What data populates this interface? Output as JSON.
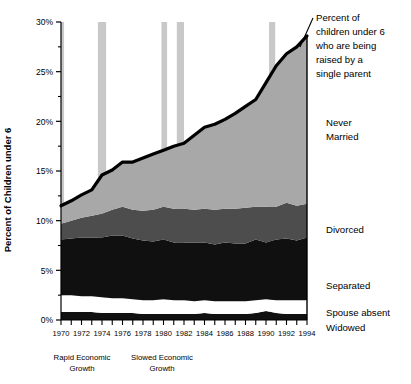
{
  "chart_data": {
    "type": "area",
    "stacked": true,
    "title": "",
    "xlabel": "",
    "ylabel": "Percent of Children under 6",
    "xlim": [
      1970,
      1994
    ],
    "ylim": [
      0,
      30
    ],
    "ytick_labels": [
      "0%",
      "5%",
      "10%",
      "15%",
      "20%",
      "25%",
      "30%"
    ],
    "ytick_values": [
      0,
      5,
      10,
      15,
      20,
      25,
      30
    ],
    "ytick_minor_values": [
      2.5,
      7.5,
      12.5,
      17.5,
      22.5,
      27.5
    ],
    "grid": false,
    "legend_position": "right-inline",
    "x": [
      1970,
      1971,
      1972,
      1973,
      1974,
      1975,
      1976,
      1977,
      1978,
      1979,
      1980,
      1981,
      1982,
      1983,
      1984,
      1985,
      1986,
      1987,
      1988,
      1989,
      1990,
      1991,
      1992,
      1993,
      1994
    ],
    "xtick_labels": [
      "1970",
      "1972",
      "1974",
      "1976",
      "1978",
      "1980",
      "1982",
      "1984",
      "1986",
      "1988",
      "1990",
      "1992",
      "1994"
    ],
    "series": [
      {
        "name": "Widowed",
        "color": "#101010",
        "values": [
          0.8,
          0.8,
          0.8,
          0.8,
          0.7,
          0.7,
          0.7,
          0.7,
          0.6,
          0.6,
          0.6,
          0.6,
          0.6,
          0.6,
          0.7,
          0.6,
          0.6,
          0.6,
          0.6,
          0.7,
          0.9,
          0.7,
          0.6,
          0.6,
          0.6
        ]
      },
      {
        "name": "Spouse absent",
        "color": "#ffffff",
        "values": [
          1.7,
          1.7,
          1.6,
          1.6,
          1.6,
          1.5,
          1.5,
          1.4,
          1.4,
          1.4,
          1.5,
          1.4,
          1.4,
          1.3,
          1.3,
          1.3,
          1.3,
          1.3,
          1.3,
          1.3,
          1.2,
          1.3,
          1.4,
          1.4,
          1.4
        ]
      },
      {
        "name": "Separated",
        "color": "#101010",
        "values": [
          5.6,
          5.7,
          5.9,
          5.9,
          6.0,
          6.3,
          6.3,
          6.1,
          6.0,
          5.9,
          6.0,
          5.8,
          5.8,
          5.9,
          5.8,
          5.7,
          5.9,
          5.8,
          5.8,
          6.1,
          5.7,
          6.1,
          6.2,
          6.0,
          6.3
        ]
      },
      {
        "name": "Divorced",
        "color": "#4d4d4d",
        "values": [
          1.6,
          1.8,
          2.0,
          2.2,
          2.4,
          2.6,
          2.9,
          2.9,
          3.0,
          3.2,
          3.3,
          3.4,
          3.4,
          3.3,
          3.4,
          3.5,
          3.4,
          3.5,
          3.6,
          3.3,
          3.6,
          3.3,
          3.6,
          3.5,
          3.4
        ]
      },
      {
        "name": "Never Married",
        "color": "#a8a8a8",
        "values": [
          1.8,
          2.0,
          2.3,
          2.6,
          3.9,
          4.0,
          4.5,
          4.8,
          5.3,
          5.6,
          5.7,
          6.3,
          6.6,
          7.5,
          8.2,
          8.6,
          9.0,
          9.6,
          10.2,
          10.8,
          12.5,
          14.2,
          15.0,
          16.0,
          16.9
        ]
      }
    ],
    "total_line": {
      "name": "Percent of children under 6 who are being raised by a single parent",
      "color": "#000000",
      "values": [
        11.5,
        12.0,
        12.6,
        13.1,
        14.6,
        15.1,
        15.9,
        15.9,
        16.3,
        16.7,
        17.1,
        17.5,
        17.8,
        18.6,
        19.4,
        19.7,
        20.2,
        20.8,
        21.5,
        22.2,
        23.9,
        25.6,
        26.8,
        27.5,
        28.6
      ]
    },
    "shaded_bands": {
      "color": "#c8c8c8",
      "label": "recession",
      "ranges": [
        [
          1969.85,
          1970.3
        ],
        [
          1973.6,
          1974.4
        ],
        [
          1979.8,
          1980.35
        ],
        [
          1981.3,
          1982.0
        ],
        [
          1990.3,
          1990.9
        ]
      ]
    },
    "annotations": [
      {
        "name": "rapid-economic-growth",
        "text_line1": "Rapid Economic",
        "text_line2": "Growth"
      },
      {
        "name": "slowed-economic-growth",
        "text_line1": "Slowed Economic",
        "text_line2": "Growth"
      }
    ],
    "callout": {
      "lines": [
        "Percent of",
        "children  under 6",
        "who are being",
        "raised by  a",
        "single parent"
      ]
    },
    "series_labels": [
      {
        "name": "Never Married",
        "lines": [
          "Never",
          "Married"
        ]
      },
      {
        "name": "Divorced",
        "lines": [
          "Divorced"
        ]
      },
      {
        "name": "Separated",
        "lines": [
          "Separated"
        ]
      },
      {
        "name": "Spouse absent",
        "lines": [
          "Spouse absent"
        ]
      },
      {
        "name": "Widowed",
        "lines": [
          "Widowed"
        ]
      }
    ]
  }
}
